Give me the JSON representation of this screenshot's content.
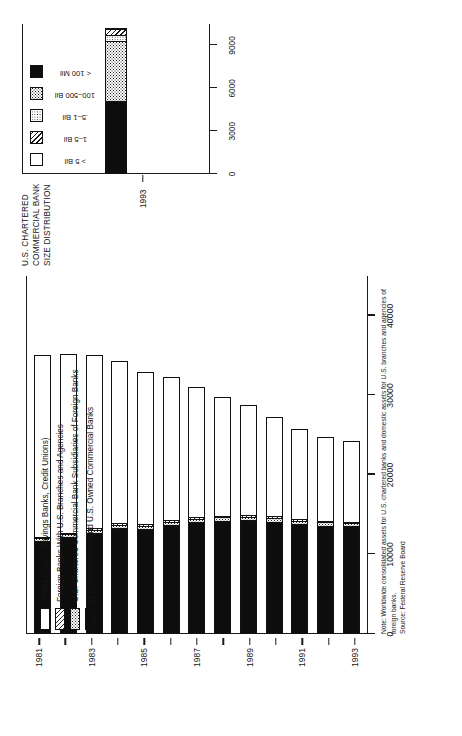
{
  "figure": {
    "orientation": "page rotated 90 degrees counter-clockwise",
    "note_line1": "Note: Worldwide consolidated assets for U.S. chartered banks and domestic assets for U.S. branches and agencies of foreign banks.",
    "note_line2": "Source: Federal Reserve Board"
  },
  "main_chart": {
    "legend": [
      {
        "key": "thrifts",
        "label": "Thrifts (S&L's, Savings Banks, Credit Unions)",
        "fill": "white"
      },
      {
        "key": "foreign_branches",
        "label": "Foreign Banks With U.S. Branches and Agencies",
        "fill": "diagonal-hatch"
      },
      {
        "key": "foreign_subs",
        "label": "U.S. Chartered Commercial Bank Subsidiaries of  Foreign Banks",
        "fill": "dotted"
      },
      {
        "key": "domestic",
        "label": "U.S. Commercial and U.S. Owned Commercial Banks",
        "fill": "black"
      }
    ],
    "x_ticks": [
      "0",
      "10000",
      "20000",
      "30000",
      "40000"
    ],
    "y_ticks": [
      "1981",
      "1983",
      "1985",
      "1987",
      "1989",
      "1991",
      "1993"
    ]
  },
  "size_panel": {
    "title": "U.S. CHARTERED\nCOMMERCIAL BANK\nSIZE DISTRIBUTION",
    "title_lines": [
      "U.S. CHARTERED",
      "COMMERCIAL BANK",
      "SIZE DISTRIBUTION"
    ],
    "legend": [
      {
        "key": "gt5",
        "label": "> 5 Bil",
        "fill": "white"
      },
      {
        "key": "1to5",
        "label": "1–5 Bil",
        "fill": "diagonal-hatch"
      },
      {
        "key": "half1",
        "label": ".5–1 Bil",
        "fill": "light-dot"
      },
      {
        "key": "mil100_500",
        "label": "100–500 Bil",
        "fill": "checker"
      },
      {
        "key": "lt100",
        "label": "< 100 Mil",
        "fill": "black"
      }
    ],
    "x_ticks": [
      "0",
      "3000",
      "6000",
      "9000"
    ],
    "y_ticks": [
      "1993"
    ]
  },
  "chart_data": [
    {
      "type": "bar",
      "id": "us-banking-assets-by-institution-type",
      "orientation": "horizontal-stacked",
      "title": "",
      "xlabel": "",
      "ylabel": "",
      "xlim": [
        0,
        45000
      ],
      "ylim": null,
      "grid": false,
      "legend_position": "inside-upper-left",
      "categories": [
        "1981",
        "1982",
        "1983",
        "1984",
        "1985",
        "1986",
        "1987",
        "1988",
        "1989",
        "1990",
        "1991",
        "1992",
        "1993"
      ],
      "series": [
        {
          "name": "U.S. Commercial and U.S. Owned Commercial Banks",
          "values": [
            11600,
            12100,
            12600,
            13200,
            13100,
            13600,
            13900,
            14100,
            14200,
            14000,
            13700,
            13500,
            13400
          ]
        },
        {
          "name": "U.S. Chartered Commercial Bank Subsidiaries of  Foreign Banks",
          "values": [
            300,
            320,
            340,
            360,
            380,
            400,
            420,
            430,
            430,
            430,
            420,
            400,
            380
          ]
        },
        {
          "name": "Foreign Banks With U.S. Branches and Agencies",
          "values": [
            180,
            190,
            200,
            210,
            220,
            230,
            240,
            240,
            240,
            240,
            230,
            220,
            210
          ]
        },
        {
          "name": "Thrifts (S&L's, Savings Banks, Credit Unions)",
          "values": [
            23000,
            22600,
            21900,
            20600,
            19200,
            18100,
            16500,
            15000,
            13900,
            12600,
            11400,
            10700,
            10300
          ]
        }
      ],
      "totals": [
        35080,
        35210,
        35040,
        34370,
        32900,
        32330,
        31060,
        29770,
        28770,
        27270,
        25750,
        24820,
        24290
      ]
    },
    {
      "type": "bar",
      "id": "us-chartered-commercial-bank-size-distribution-1993",
      "orientation": "horizontal-stacked",
      "title": "U.S. CHARTERED COMMERCIAL BANK SIZE DISTRIBUTION",
      "xlabel": "",
      "ylabel": "",
      "xlim": [
        0,
        10500
      ],
      "grid": false,
      "legend_position": "above-plot",
      "categories": [
        "1993"
      ],
      "segments": [
        {
          "name": "< 100 Mil",
          "value": 5050
        },
        {
          "name": "100–500 Bil",
          "value": 4200
        },
        {
          "name": ".5–1 Bil",
          "value": 380
        },
        {
          "name": "1–5 Bil",
          "value": 460
        },
        {
          "name": "> 5 Bil",
          "value": 110
        }
      ]
    }
  ]
}
